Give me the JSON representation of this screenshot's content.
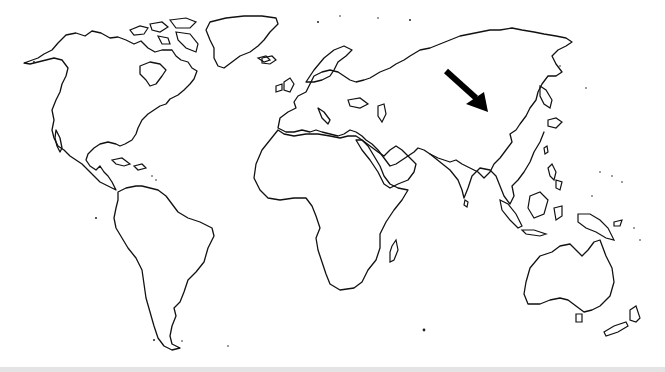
{
  "map": {
    "type": "world-outline",
    "projection": "equirectangular-like",
    "style": "black outline on white",
    "stroke_color": "#111111",
    "background_color": "#ffffff",
    "continents": [
      "North America",
      "South America",
      "Europe",
      "Africa",
      "Asia",
      "Australia",
      "Greenland"
    ],
    "annotation": {
      "type": "arrow",
      "icon": "arrow-down-right-icon",
      "color": "#000000",
      "from": [
        444,
        70
      ],
      "to": [
        487,
        110
      ],
      "points_to": "China / Central Asia"
    }
  },
  "labels": {
    "map_title": "World map outline with arrow"
  }
}
